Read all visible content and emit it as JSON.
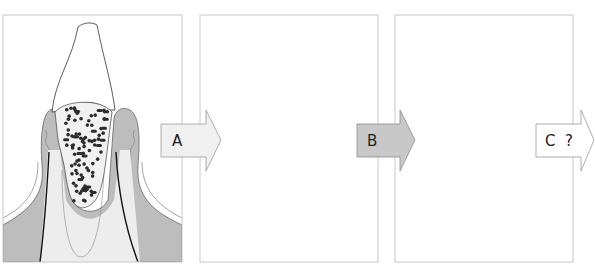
{
  "diagram": {
    "panels": [
      {
        "id": "stage-1",
        "description": "Dense bacterial plaque in deep pocket",
        "density": "high"
      },
      {
        "id": "stage-2",
        "description": "Sparse bacteria after treatment",
        "density": "low"
      },
      {
        "id": "stage-3",
        "description": "Recolonisation of pocket",
        "density": "medium"
      }
    ],
    "arrows": [
      {
        "label": "A",
        "fill": "#f0f0f0"
      },
      {
        "label": "B",
        "fill": "#c8c8c8"
      },
      {
        "label": "C  ?",
        "fill": "#ffffff"
      }
    ],
    "colors": {
      "gingiva": "#bdbdbd",
      "bone": "#a9a9a9",
      "root": "#ededed",
      "crown": "#ffffff",
      "pocket": "#f1f1f1",
      "bacteria": "#2b2b2b",
      "panel_border": "#c8c8c8"
    }
  }
}
